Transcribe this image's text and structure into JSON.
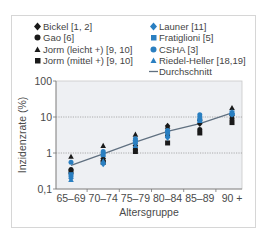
{
  "chart_data": {
    "type": "scatter",
    "title": "",
    "xlabel": "Altersgruppe",
    "ylabel": "Inzidenzrate (%)",
    "yscale": "log",
    "ylim": [
      0.1,
      100
    ],
    "yticks": [
      "0,1",
      "1",
      "10",
      "100"
    ],
    "grid": "horizontal dotted at 1 and 10",
    "legend_position": "top, two columns",
    "categories": [
      "65–69",
      "70–74",
      "75–79",
      "80–84",
      "85–89",
      "90 +"
    ],
    "series": [
      {
        "name": "Bickel [1, 2]",
        "marker": "diamond",
        "color": "#1a1a1a",
        "values": [
          null,
          0.7,
          1.6,
          5.6,
          6.5,
          11
        ]
      },
      {
        "name": "Gao [6]",
        "marker": "circle",
        "color": "#1a1a1a",
        "values": [
          0.35,
          0.6,
          1.3,
          3.0,
          4.5,
          9
        ]
      },
      {
        "name": "Jorm (leicht +) [9, 10]",
        "marker": "triangle",
        "color": "#1a1a1a",
        "values": [
          0.8,
          1.6,
          3.3,
          5.5,
          9,
          18
        ]
      },
      {
        "name": "Jorm (mittel +) [9, 10]",
        "marker": "square",
        "color": "#1a1a1a",
        "values": [
          0.3,
          0.55,
          1.1,
          1.9,
          3.6,
          7
        ]
      },
      {
        "name": "Launer [11]",
        "marker": "diamond",
        "color": "#2a7fc1",
        "values": [
          0.2,
          0.5,
          2.2,
          2.7,
          10,
          12
        ]
      },
      {
        "name": "Fratiglioni [5]",
        "marker": "square",
        "color": "#2a7fc1",
        "values": [
          0.25,
          0.9,
          2.0,
          3.8,
          8,
          13
        ]
      },
      {
        "name": "CSHA [3]",
        "marker": "circle",
        "color": "#2a7fc1",
        "values": [
          0.55,
          1.1,
          2.5,
          4.2,
          11.5,
          12
        ]
      },
      {
        "name": "Riedel-Heller [18,19]",
        "marker": "triangle",
        "color": "#2a7fc1",
        "values": [
          0.18,
          0.6,
          1.6,
          3.2,
          9.5,
          14
        ]
      },
      {
        "name": "Durchschnitt",
        "marker": "line",
        "color": "#607080",
        "values": [
          0.45,
          0.95,
          2.0,
          4.0,
          6.5,
          13
        ]
      }
    ]
  },
  "legend": {
    "left": [
      {
        "label": "Bickel [1, 2]",
        "marker": "diamond",
        "color": "#1a1a1a"
      },
      {
        "label": "Gao [6]",
        "marker": "circle",
        "color": "#1a1a1a"
      },
      {
        "label": "Jorm (leicht +) [9, 10]",
        "marker": "triangle",
        "color": "#1a1a1a"
      },
      {
        "label": "Jorm (mittel +) [9, 10]",
        "marker": "square",
        "color": "#1a1a1a"
      }
    ],
    "right": [
      {
        "label": "Launer [11]",
        "marker": "diamond",
        "color": "#2a7fc1"
      },
      {
        "label": "Fratiglioni [5]",
        "marker": "square",
        "color": "#2a7fc1"
      },
      {
        "label": "CSHA [3]",
        "marker": "circle",
        "color": "#2a7fc1"
      },
      {
        "label": "Riedel-Heller [18,19]",
        "marker": "triangle",
        "color": "#2a7fc1"
      },
      {
        "label": "Durchschnitt",
        "marker": "line",
        "color": "#607080"
      }
    ]
  },
  "axes": {
    "xlabel": "Altersgruppe",
    "ylabel": "Inzidenzrate (%)",
    "yticks": [
      "100",
      "10",
      "1",
      "0,1"
    ],
    "xticks": [
      "65–69",
      "70–74",
      "75–79",
      "80–84",
      "85–89",
      "90 +"
    ]
  },
  "colors": {
    "black_marker": "#1a1a1a",
    "blue_marker": "#2a7fc1",
    "average_line": "#607080",
    "plot_bg": "#eef0f3",
    "frame": "#d6d6d6"
  }
}
